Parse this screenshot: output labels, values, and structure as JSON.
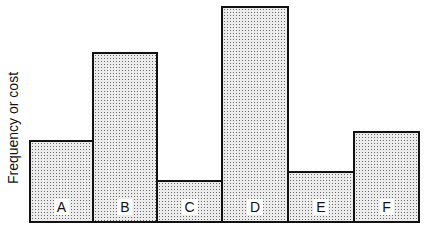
{
  "chart_data": {
    "type": "bar",
    "title": "",
    "xlabel": "",
    "ylabel": "Frequency or cost",
    "categories": [
      "A",
      "B",
      "C",
      "D",
      "E",
      "F"
    ],
    "values": [
      81,
      169,
      41,
      215,
      50,
      90
    ],
    "value_units": "relative (no numeric axis shown)",
    "ylim": [
      0,
      215
    ],
    "grid": false,
    "legend": null,
    "bar_gap": 0,
    "fill": "stippled dot pattern"
  },
  "layout": {
    "baseline_y": 221,
    "plot_left_x": 29,
    "bar_edges_x": [
      29,
      93,
      157,
      222,
      288,
      354,
      419
    ],
    "max_height_px": 215
  }
}
